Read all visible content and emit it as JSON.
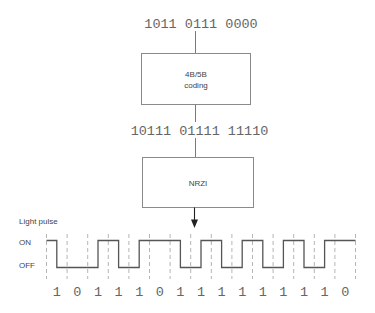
{
  "input_bits": "1011 0111 0000",
  "encoder_box": {
    "line1": "4B/5B",
    "line2": "coding"
  },
  "encoded_bits": "10111 01111 11110",
  "nrzi_box": {
    "label": "NRZI"
  },
  "signal": {
    "title": "Light pulse",
    "on_label": "ON",
    "off_label": "OFF",
    "initial_level": "ON",
    "bits": [
      1,
      0,
      1,
      1,
      1,
      0,
      1,
      1,
      1,
      1,
      1,
      1,
      1,
      1,
      0
    ]
  },
  "colors": {
    "text": "#666666",
    "box_border": "#8a8a8a",
    "waveform": "#555555",
    "grid_dash": "#b5b5b5",
    "arrow": "#222222"
  }
}
